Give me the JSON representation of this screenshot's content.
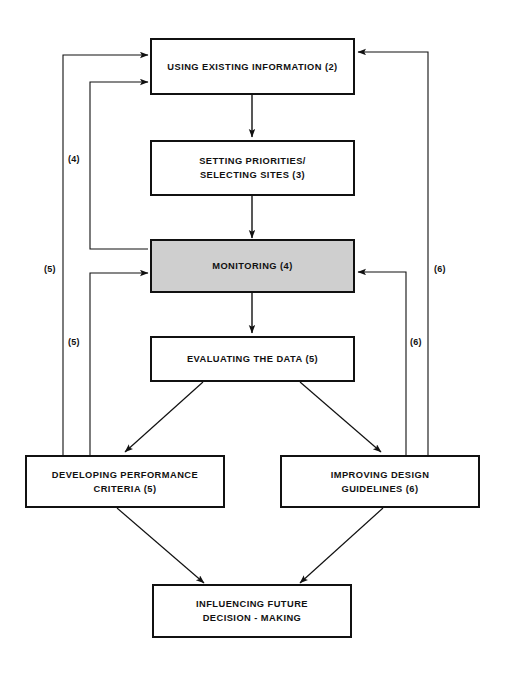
{
  "diagram": {
    "background_color": "#ffffff",
    "line_color": "#111111",
    "shaded_fill": "#cfcfcf",
    "nodes": [
      {
        "id": "using-existing-information",
        "label": "USING EXISTING INFORMATION (2)",
        "shaded": false
      },
      {
        "id": "setting-priorities",
        "label": "SETTING PRIORITIES/\nSELECTING SITES (3)",
        "shaded": false
      },
      {
        "id": "monitoring",
        "label": "MONITORING (4)",
        "shaded": true
      },
      {
        "id": "evaluating-the-data",
        "label": "EVALUATING THE DATA (5)",
        "shaded": false
      },
      {
        "id": "developing-performance-criteria",
        "label": "DEVELOPING PERFORMANCE\nCRITERIA (5)",
        "shaded": false
      },
      {
        "id": "improving-design-guidelines",
        "label": "IMPROVING DESIGN\nGUIDELINES (6)",
        "shaded": false
      },
      {
        "id": "influencing-future-decision-making",
        "label": "INFLUENCING FUTURE\nDECISION - MAKING",
        "shaded": false
      }
    ],
    "edge_labels": [
      {
        "id": "label-4-left",
        "text": "(4)"
      },
      {
        "id": "label-5-far-left",
        "text": "(5)"
      },
      {
        "id": "label-5-left",
        "text": "(5)"
      },
      {
        "id": "label-6-far-right",
        "text": "(6)"
      },
      {
        "id": "label-6-right",
        "text": "(6)"
      }
    ]
  }
}
